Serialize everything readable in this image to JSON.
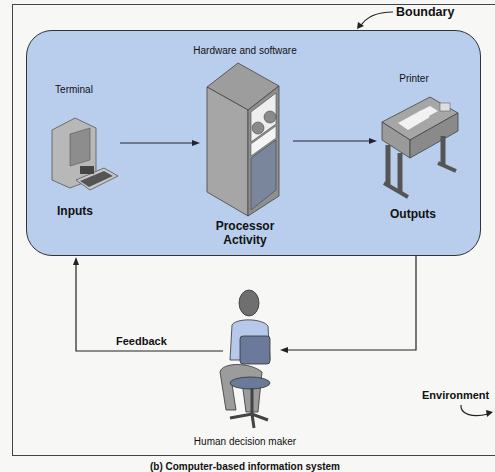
{
  "diagram": {
    "labels": {
      "boundary": "Boundary",
      "hardware_software": "Hardware and software",
      "terminal": "Terminal",
      "printer": "Printer",
      "inputs": "Inputs",
      "processor_line1": "Processor",
      "processor_line2": "Activity",
      "outputs": "Outputs",
      "feedback": "Feedback",
      "human": "Human decision maker",
      "environment": "Environment",
      "caption": "(b) Computer-based information system"
    },
    "colors": {
      "boundary_fill": "#b9cdec",
      "line": "#222222",
      "device_gray": "#9a9a9a",
      "shirt": "#b7c9ea",
      "chair": "#6b7a9a"
    }
  }
}
